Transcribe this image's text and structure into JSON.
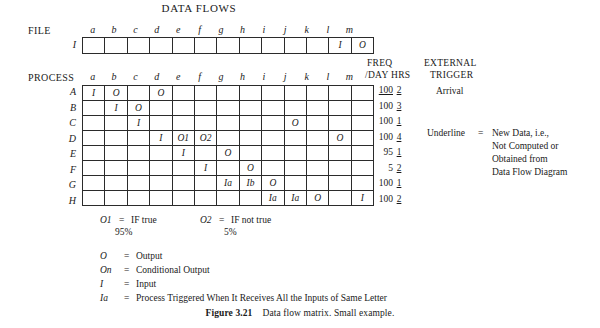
{
  "title": "DATA FLOWS",
  "labels": {
    "file": "FILE",
    "process": "PROCESS",
    "freq_line1": "FREQ",
    "freq_line2": "/DAY",
    "hrs": "HRS",
    "ext_line1": "EXTERNAL",
    "ext_line2": "TRIGGER"
  },
  "columns": [
    "a",
    "b",
    "c",
    "d",
    "e",
    "f",
    "g",
    "h",
    "i",
    "j",
    "k",
    "l",
    "m"
  ],
  "file_table": {
    "rows": [
      {
        "name": "I",
        "cells": [
          "",
          "",
          "",
          "",
          "",
          "",
          "",
          "",
          "",
          "",
          "",
          "I",
          "O"
        ]
      }
    ]
  },
  "process_table": {
    "rows": [
      {
        "name": "A",
        "cells": [
          "I",
          "O",
          "",
          "O",
          "",
          "",
          "",
          "",
          "",
          "",
          "",
          "",
          ""
        ],
        "freq": "100",
        "freq_underline": true,
        "hrs": "2",
        "hrs_underline": true,
        "trigger": "Arrival"
      },
      {
        "name": "B",
        "cells": [
          "",
          "I",
          "O",
          "",
          "",
          "",
          "",
          "",
          "",
          "",
          "",
          "",
          ""
        ],
        "freq": "100",
        "freq_underline": false,
        "hrs": "3",
        "hrs_underline": true,
        "trigger": ""
      },
      {
        "name": "C",
        "cells": [
          "",
          "",
          "I",
          "",
          "",
          "",
          "",
          "",
          "",
          "O",
          "",
          "",
          ""
        ],
        "freq": "100",
        "freq_underline": false,
        "hrs": "1",
        "hrs_underline": true,
        "trigger": ""
      },
      {
        "name": "D",
        "cells": [
          "",
          "",
          "",
          "I",
          "O1",
          "O2",
          "",
          "",
          "",
          "",
          "",
          "O",
          ""
        ],
        "freq": "100",
        "freq_underline": false,
        "hrs": "4",
        "hrs_underline": true,
        "trigger": ""
      },
      {
        "name": "E",
        "cells": [
          "",
          "",
          "",
          "",
          "I",
          "",
          "O",
          "",
          "",
          "",
          "",
          "",
          ""
        ],
        "freq": "95",
        "freq_underline": false,
        "hrs": "1",
        "hrs_underline": true,
        "trigger": ""
      },
      {
        "name": "F",
        "cells": [
          "",
          "",
          "",
          "",
          "",
          "I",
          "",
          "O",
          "",
          "",
          "",
          "",
          ""
        ],
        "freq": "5",
        "freq_underline": false,
        "hrs": "2",
        "hrs_underline": true,
        "trigger": ""
      },
      {
        "name": "G",
        "cells": [
          "",
          "",
          "",
          "",
          "",
          "",
          "Ia",
          "Ib",
          "O",
          "",
          "",
          "",
          ""
        ],
        "freq": "100",
        "freq_underline": false,
        "hrs": "1",
        "hrs_underline": true,
        "trigger": ""
      },
      {
        "name": "H",
        "cells": [
          "",
          "",
          "",
          "",
          "",
          "",
          "",
          "",
          "Ia",
          "Ia",
          "O",
          "",
          "I"
        ],
        "freq": "100",
        "freq_underline": false,
        "hrs": "2",
        "hrs_underline": true,
        "trigger": ""
      }
    ]
  },
  "underline_note": {
    "term": "Underline",
    "eq": "=",
    "lines": [
      "New Data, i.e.,",
      "Not Computed or",
      "Obtained from",
      "Data Flow Diagram"
    ]
  },
  "conditional_notes": [
    {
      "symbol": "O1",
      "eq": "=",
      "text": "IF true",
      "pct": "95%"
    },
    {
      "symbol": "O2",
      "eq": "=",
      "text": "IF not true",
      "pct": "5%"
    }
  ],
  "legend": [
    {
      "symbol": "O",
      "eq": "=",
      "text": "Output"
    },
    {
      "symbol": "On",
      "eq": "=",
      "text": "Conditional Output"
    },
    {
      "symbol": "I",
      "eq": "=",
      "text": "Input"
    },
    {
      "symbol": "Ia",
      "eq": "=",
      "text": "Process Triggered When It Receives All the Inputs of Same Letter"
    }
  ],
  "caption": {
    "figure": "Figure 3.21",
    "text": "Data flow matrix. Small example."
  }
}
